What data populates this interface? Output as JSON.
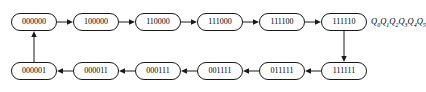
{
  "diagram": {
    "bit_order_label": "Q0Q1Q2Q3Q4Q5",
    "bit_order_parts": [
      "Q",
      "0",
      "Q",
      "1",
      "Q",
      "2",
      "Q",
      "3",
      "Q",
      "4",
      "Q",
      "5"
    ],
    "colors": {
      "background": "#ffffff",
      "node_fill": "#ffffff",
      "node_stroke": "#1a1a1a",
      "edge_stroke": "#1a1a1a",
      "text": "#000000"
    },
    "node_shape": "rounded-rectangle",
    "top_row": [
      {
        "id": "s0",
        "label": "000000",
        "x": 11,
        "y": 13
      },
      {
        "id": "s1",
        "label": "100000",
        "x": 73,
        "y": 13
      },
      {
        "id": "s2",
        "label": "110000",
        "x": 135,
        "y": 13
      },
      {
        "id": "s3",
        "label": "111000",
        "x": 197,
        "y": 13
      },
      {
        "id": "s4",
        "label": "111100",
        "x": 259,
        "y": 13
      },
      {
        "id": "s5",
        "label": "111110",
        "x": 301,
        "y": 13
      }
    ],
    "bottom_row": [
      {
        "id": "s6",
        "label": "000001",
        "x": 11,
        "y": 62
      },
      {
        "id": "s7",
        "label": "000011",
        "x": 73,
        "y": 62
      },
      {
        "id": "s8",
        "label": "000111",
        "x": 135,
        "y": 62
      },
      {
        "id": "s9",
        "label": "001111",
        "x": 197,
        "y": 62
      },
      {
        "id": "s10",
        "label": "011111",
        "x": 259,
        "y": 62
      },
      {
        "id": "s11",
        "label": "111111",
        "x": 301,
        "y": 62
      }
    ],
    "states_in_cycle_order": [
      "000000",
      "100000",
      "110000",
      "111000",
      "111100",
      "111110",
      "111111",
      "011111",
      "001111",
      "000111",
      "000011",
      "000001"
    ],
    "edges": [
      {
        "from": "000000",
        "to": "100000",
        "direction": "right"
      },
      {
        "from": "100000",
        "to": "110000",
        "direction": "right"
      },
      {
        "from": "110000",
        "to": "111000",
        "direction": "right"
      },
      {
        "from": "111000",
        "to": "111100",
        "direction": "right"
      },
      {
        "from": "111100",
        "to": "111110",
        "direction": "right"
      },
      {
        "from": "111110",
        "to": "111111",
        "direction": "down"
      },
      {
        "from": "111111",
        "to": "011111",
        "direction": "left"
      },
      {
        "from": "011111",
        "to": "001111",
        "direction": "left"
      },
      {
        "from": "001111",
        "to": "000111",
        "direction": "left"
      },
      {
        "from": "000111",
        "to": "000011",
        "direction": "left"
      },
      {
        "from": "000011",
        "to": "000001",
        "direction": "left"
      },
      {
        "from": "000001",
        "to": "000000",
        "direction": "up"
      }
    ]
  }
}
